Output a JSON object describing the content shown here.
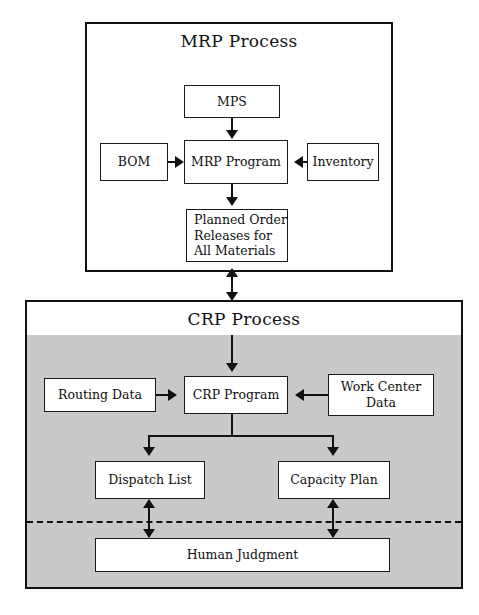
{
  "diagram": {
    "sections": [
      {
        "id": "mrp",
        "title": "MRP Process",
        "background": "#ffffff"
      },
      {
        "id": "crp",
        "title": "CRP Process",
        "background": "#c9c9c9"
      }
    ],
    "nodes": {
      "mps": "MPS",
      "bom": "BOM",
      "mrp_program": "MRP Program",
      "inventory": "Inventory",
      "planned_order_line1": "Planned Order",
      "planned_order_line2": "Releases for",
      "planned_order_line3": "All Materials",
      "routing_data": "Routing Data",
      "crp_program": "CRP Program",
      "work_center_line1": "Work Center",
      "work_center_line2": "Data",
      "dispatch_list": "Dispatch List",
      "capacity_plan": "Capacity Plan",
      "human_judgment": "Human Judgment"
    },
    "colors": {
      "line": "#111111",
      "node_fill": "#ffffff",
      "crp_panel_fill": "#c9c9c9"
    }
  }
}
